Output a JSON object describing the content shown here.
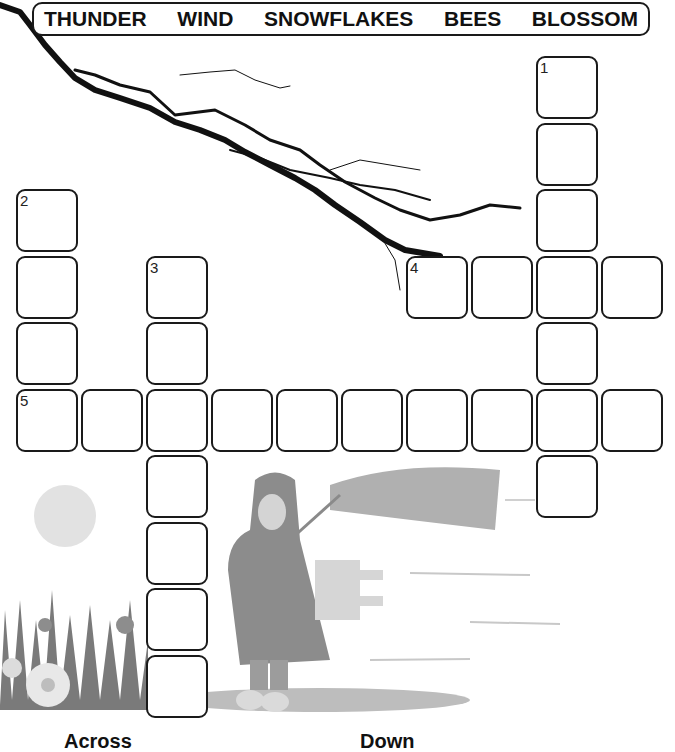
{
  "word_bank": [
    "THUNDER",
    "WIND",
    "SNOWFLAKES",
    "BEES",
    "BLOSSOM"
  ],
  "clue_headings": {
    "across": "Across",
    "down": "Down"
  },
  "grid": {
    "cell_size": 65,
    "origin": {
      "x": 16,
      "y": 56
    },
    "words": [
      {
        "number": "1",
        "direction": "down",
        "col": 8,
        "row": 0,
        "length": 7
      },
      {
        "number": "2",
        "direction": "down",
        "col": 0,
        "row": 2,
        "length": 4
      },
      {
        "number": "3",
        "direction": "down",
        "col": 2,
        "row": 3,
        "length": 7
      },
      {
        "number": "4",
        "direction": "across",
        "col": 6,
        "row": 3,
        "length": 4
      },
      {
        "number": "5",
        "direction": "across",
        "col": 0,
        "row": 5,
        "length": 10
      }
    ]
  },
  "illustrations": [
    "lightning-bolt",
    "sun",
    "flowers-with-bees",
    "girl-with-umbrella-in-wind"
  ]
}
